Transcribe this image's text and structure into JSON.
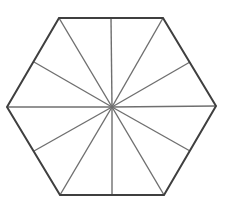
{
  "diagram": {
    "type": "hexagon-subdivision",
    "center": [
      112,
      107
    ],
    "vertices": [
      [
        59,
        18
      ],
      [
        163,
        18
      ],
      [
        216,
        106
      ],
      [
        164,
        195
      ],
      [
        60,
        195
      ],
      [
        7,
        107
      ]
    ],
    "edge_midpoints": [
      [
        111,
        18
      ],
      [
        190,
        62
      ],
      [
        190,
        151
      ],
      [
        112,
        195
      ],
      [
        34,
        151
      ],
      [
        34,
        62
      ]
    ],
    "triangle_count": 12,
    "colors": {
      "background": "#ffffff",
      "outline": "#3f3f3f",
      "spokes": "#6f6f6f"
    },
    "stroke_widths": {
      "outline": 2,
      "spokes": 1.4
    }
  }
}
